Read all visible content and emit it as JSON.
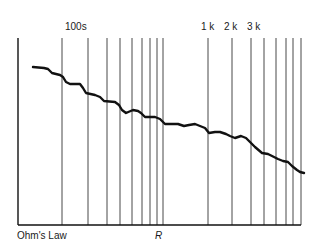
{
  "chart_data": {
    "type": "line",
    "title": "",
    "xlabel": "R",
    "ylabel": "",
    "caption": "Ohm's Law",
    "top_labels": [
      {
        "text": "100s",
        "x": 64
      },
      {
        "text": "1 k",
        "x": 201
      },
      {
        "text": "2 k",
        "x": 224
      },
      {
        "text": "3 k",
        "x": 247
      }
    ],
    "axis": {
      "left_x": 18,
      "bottom_y": 225,
      "right_x": 301,
      "top_y": 38
    },
    "gridlines_x": [
      62,
      88,
      107,
      120,
      132,
      142,
      150,
      157,
      163,
      208,
      232,
      251,
      264,
      276,
      286,
      293,
      301
    ],
    "grid": true,
    "legend": null,
    "series": [
      {
        "name": "curve",
        "points": [
          [
            33,
            67
          ],
          [
            44,
            68
          ],
          [
            48,
            69
          ],
          [
            52,
            73
          ],
          [
            60,
            75
          ],
          [
            63,
            77
          ],
          [
            66,
            82
          ],
          [
            70,
            84
          ],
          [
            80,
            84
          ],
          [
            83,
            88
          ],
          [
            86,
            93
          ],
          [
            95,
            95
          ],
          [
            100,
            97
          ],
          [
            104,
            101
          ],
          [
            115,
            102
          ],
          [
            119,
            105
          ],
          [
            122,
            110
          ],
          [
            126,
            113
          ],
          [
            133,
            110
          ],
          [
            138,
            111
          ],
          [
            141,
            113
          ],
          [
            145,
            117
          ],
          [
            155,
            117
          ],
          [
            160,
            119
          ],
          [
            165,
            124
          ],
          [
            172,
            124
          ],
          [
            178,
            124
          ],
          [
            184,
            126
          ],
          [
            189,
            125
          ],
          [
            195,
            124
          ],
          [
            200,
            126
          ],
          [
            205,
            128
          ],
          [
            209,
            133
          ],
          [
            215,
            132
          ],
          [
            220,
            132
          ],
          [
            226,
            134
          ],
          [
            230,
            136
          ],
          [
            235,
            138
          ],
          [
            241,
            136
          ],
          [
            246,
            138
          ],
          [
            250,
            142
          ],
          [
            255,
            147
          ],
          [
            262,
            153
          ],
          [
            268,
            154
          ],
          [
            272,
            156
          ],
          [
            278,
            159
          ],
          [
            283,
            161
          ],
          [
            288,
            162
          ],
          [
            292,
            166
          ],
          [
            297,
            170
          ],
          [
            300,
            172
          ],
          [
            304,
            173
          ]
        ]
      }
    ]
  },
  "labels": {
    "top_100s": "100s",
    "top_1k": "1 k",
    "top_2k": "2 k",
    "top_3k": "3 k",
    "bottom_left": "Ohm's Law",
    "bottom_axis": "R"
  },
  "colors": {
    "line": "#111111",
    "grid": "#333333",
    "background": "#ffffff"
  }
}
